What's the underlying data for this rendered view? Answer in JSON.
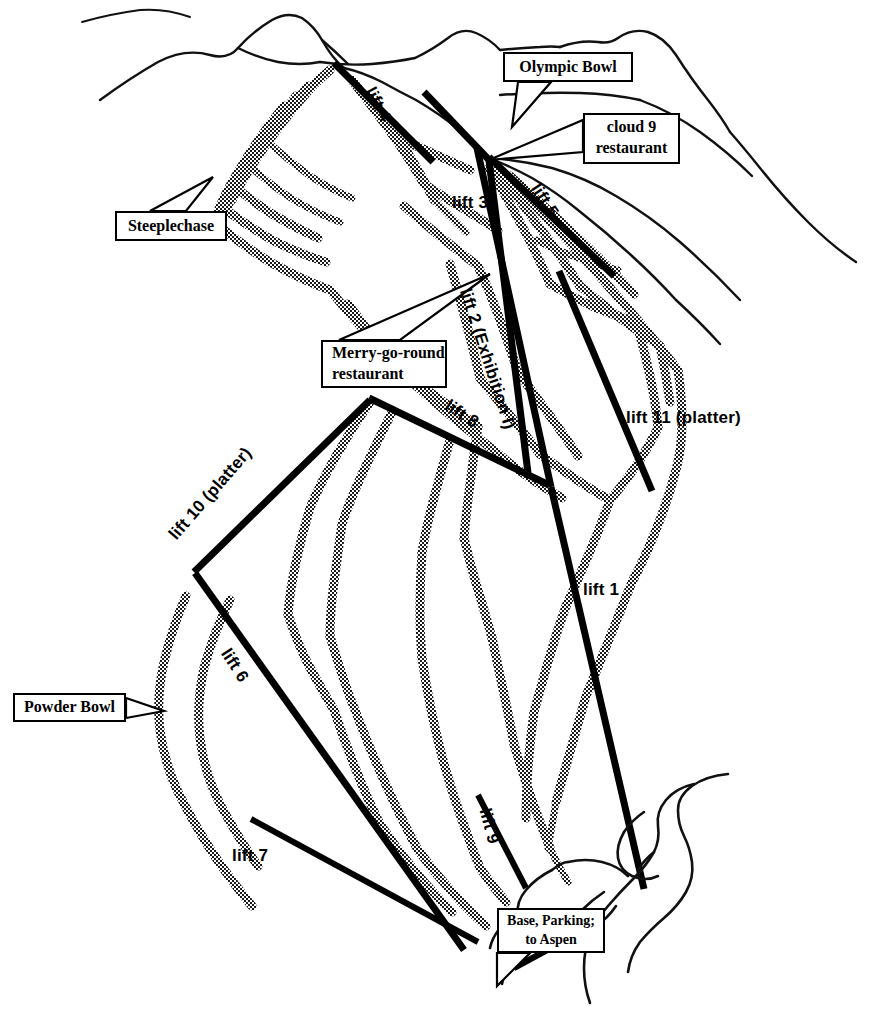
{
  "map": {
    "title": "Ski resort trail map",
    "background_color": "#ffffff",
    "ink_color": "#000000"
  },
  "callouts": [
    {
      "id": "olympic-bowl",
      "label": "Olympic Bowl",
      "lines": [
        "Olympic Bowl"
      ],
      "x": 503,
      "y": 52,
      "width": 130,
      "height": 30
    },
    {
      "id": "cloud-9-restaurant",
      "label": "cloud 9 restaurant",
      "lines": [
        "cloud 9",
        "restaurant"
      ],
      "x": 583,
      "y": 113,
      "width": 97,
      "height": 51
    },
    {
      "id": "steeplechase",
      "label": "Steeplechase",
      "lines": [
        "Steeplechase"
      ],
      "x": 115,
      "y": 211,
      "width": 112,
      "height": 30
    },
    {
      "id": "merry-go-round-restaurant",
      "label": "Merry-go-round restaurant",
      "lines": [
        "Merry-go-round",
        "restaurant"
      ],
      "x": 321,
      "y": 340,
      "width": 126,
      "height": 48
    },
    {
      "id": "powder-bowl",
      "label": "Powder Bowl",
      "lines": [
        "Powder Bowl"
      ],
      "x": 13,
      "y": 693,
      "width": 113,
      "height": 29
    },
    {
      "id": "base-parking-to-aspen",
      "label": "Base, Parking; to Aspen",
      "lines": [
        "Base, Parking;",
        "to Aspen"
      ],
      "x": 497,
      "y": 908,
      "width": 108,
      "height": 45
    }
  ],
  "lifts": [
    {
      "id": "lift-1",
      "label": "lift 1",
      "rotation": 0,
      "x": 583,
      "y": 580
    },
    {
      "id": "lift-2",
      "label": "lift 2 (Exhibition I)",
      "rotation": 72,
      "x": 474,
      "y": 286
    },
    {
      "id": "lift-3",
      "label": "lift 3",
      "rotation": 0,
      "x": 452,
      "y": 193
    },
    {
      "id": "lift-4",
      "label": "lift 4",
      "rotation": 62,
      "x": 378,
      "y": 84
    },
    {
      "id": "lift-5",
      "label": "lift 5",
      "rotation": 57,
      "x": 543,
      "y": 180
    },
    {
      "id": "lift-6",
      "label": "lift 6",
      "rotation": 57,
      "x": 233,
      "y": 645
    },
    {
      "id": "lift-7",
      "label": "lift 7",
      "rotation": 0,
      "x": 232,
      "y": 846
    },
    {
      "id": "lift-8",
      "label": "lift 8",
      "rotation": 33,
      "x": 452,
      "y": 396
    },
    {
      "id": "lift-9",
      "label": "lift 9",
      "rotation": 75,
      "x": 494,
      "y": 806
    },
    {
      "id": "lift-10",
      "label": "lift 10 (platter)",
      "rotation": -49,
      "x": 165,
      "y": 531
    },
    {
      "id": "lift-11",
      "label": "lift 11 (platter)",
      "rotation": 0,
      "x": 626,
      "y": 408
    }
  ],
  "lift_lines": [
    {
      "id": "lift-4-line",
      "x1": 334,
      "y1": 63,
      "x2": 433,
      "y2": 162
    },
    {
      "id": "lift-3-line",
      "x1": 424,
      "y1": 92,
      "x2": 492,
      "y2": 163
    },
    {
      "id": "lift-3-lower",
      "x1": 477,
      "y1": 148,
      "x2": 551,
      "y2": 487
    },
    {
      "id": "lift-5-line",
      "x1": 489,
      "y1": 157,
      "x2": 614,
      "y2": 276
    },
    {
      "id": "lift-2-line",
      "x1": 489,
      "y1": 160,
      "x2": 528,
      "y2": 473
    },
    {
      "id": "lift-11-line",
      "x1": 559,
      "y1": 271,
      "x2": 652,
      "y2": 491
    },
    {
      "id": "lift-8-line",
      "x1": 369,
      "y1": 398,
      "x2": 549,
      "y2": 485
    },
    {
      "id": "lift-1-line",
      "x1": 551,
      "y1": 487,
      "x2": 644,
      "y2": 889
    },
    {
      "id": "lift-10-line",
      "x1": 370,
      "y1": 400,
      "x2": 194,
      "y2": 572
    },
    {
      "id": "lift-6-line",
      "x1": 195,
      "y1": 573,
      "x2": 464,
      "y2": 950
    },
    {
      "id": "lift-7-line",
      "x1": 251,
      "y1": 819,
      "x2": 478,
      "y2": 942
    },
    {
      "id": "lift-9-line",
      "x1": 478,
      "y1": 795,
      "x2": 526,
      "y2": 888
    },
    {
      "id": "lift-base-line",
      "x1": 514,
      "y1": 968,
      "x2": 573,
      "y2": 936
    }
  ]
}
